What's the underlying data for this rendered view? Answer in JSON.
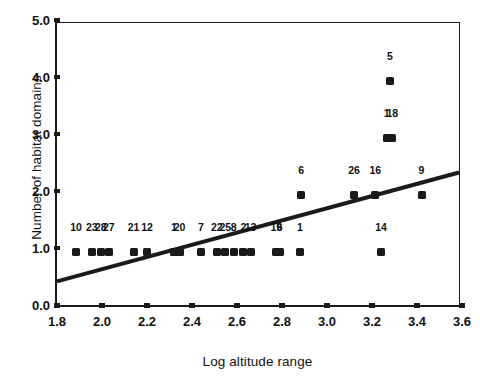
{
  "chart_data": {
    "type": "scatter",
    "title": "",
    "xlabel": "Log altitude range",
    "ylabel": "Number of habitat domains",
    "xlim": [
      1.8,
      3.6
    ],
    "ylim": [
      0.0,
      5.0
    ],
    "xticks": [
      "1.8",
      "2.0",
      "2.2",
      "2.4",
      "2.6",
      "2.8",
      "3.0",
      "3.2",
      "3.4",
      "3.6"
    ],
    "yticks": [
      "0.0",
      "1.0",
      "2.0",
      "3.0",
      "4.0",
      "5.0"
    ],
    "grid": false,
    "legend": null,
    "marker": "filled-square",
    "marker_color": "#1a1a1a",
    "points": [
      {
        "label": "10",
        "x": 1.885,
        "y": 1.0
      },
      {
        "label": "23",
        "x": 1.955,
        "y": 1.0
      },
      {
        "label": "28",
        "x": 1.995,
        "y": 1.0
      },
      {
        "label": "27",
        "x": 2.03,
        "y": 1.0
      },
      {
        "label": "21",
        "x": 2.14,
        "y": 1.0
      },
      {
        "label": "12",
        "x": 2.2,
        "y": 1.0
      },
      {
        "label": "1",
        "x": 2.32,
        "y": 1.0
      },
      {
        "label": "20",
        "x": 2.345,
        "y": 1.0
      },
      {
        "label": "7",
        "x": 2.44,
        "y": 1.0
      },
      {
        "label": "22",
        "x": 2.51,
        "y": 1.0
      },
      {
        "label": "25",
        "x": 2.548,
        "y": 1.0
      },
      {
        "label": "8",
        "x": 2.585,
        "y": 1.0
      },
      {
        "label": "2",
        "x": 2.628,
        "y": 1.0
      },
      {
        "label": "13",
        "x": 2.66,
        "y": 1.0
      },
      {
        "label": "19",
        "x": 2.775,
        "y": 1.0
      },
      {
        "label": "6",
        "x": 2.79,
        "y": 1.0
      },
      {
        "label": "1",
        "x": 2.88,
        "y": 1.0
      },
      {
        "label": "14",
        "x": 3.24,
        "y": 1.0
      },
      {
        "label": "6",
        "x": 2.885,
        "y": 2.0
      },
      {
        "label": "26",
        "x": 3.12,
        "y": 2.0
      },
      {
        "label": "16",
        "x": 3.215,
        "y": 2.0
      },
      {
        "label": "9",
        "x": 3.42,
        "y": 2.0
      },
      {
        "label": "1",
        "x": 3.265,
        "y": 3.0
      },
      {
        "label": "18",
        "x": 3.29,
        "y": 3.0
      },
      {
        "label": "5",
        "x": 3.28,
        "y": 4.0
      }
    ],
    "trendline": {
      "type": "linear-fit",
      "x0": 1.8,
      "y0": 0.42,
      "x1": 3.6,
      "y1": 2.35,
      "color": "#1a1a1a",
      "width_px": 4
    }
  }
}
